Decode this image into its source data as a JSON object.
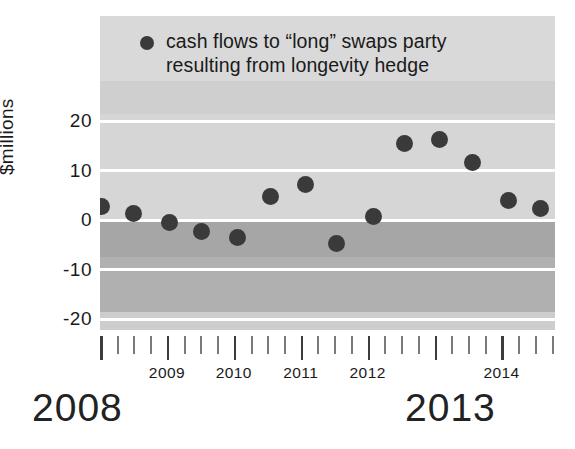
{
  "chart_data": {
    "type": "scatter",
    "title": "",
    "subtitle": "",
    "xlabel": "",
    "ylabel": "$millions",
    "ylim": [
      -25,
      28
    ],
    "xlim": [
      2008.0,
      2014.75
    ],
    "grid": true,
    "legend_position": "top-left-inside",
    "legend": [
      "cash flows to “long” swaps party\nresulting from longevity hedge"
    ],
    "yticks": [
      20,
      10,
      0,
      -10,
      -20
    ],
    "ytick_labels": [
      "20",
      "10",
      "0",
      "-10",
      "-20"
    ],
    "xtick_labels": [
      "2009",
      "2010",
      "2011",
      "2012",
      "2014"
    ],
    "xtick_label_values": [
      2009,
      2010,
      2011,
      2012,
      2014
    ],
    "series": [
      {
        "name": "cash flows to “long” swaps party resulting from longevity hedge",
        "marker": "circle",
        "color": "#3a3a3a",
        "x": [
          2008.12,
          2008.38,
          2008.63,
          2008.88,
          2009.25,
          2009.62,
          2010.0,
          2010.38,
          2010.87,
          2011.25,
          2011.62,
          2011.9,
          2012.25,
          2012.62
        ],
        "values": [
          2.8,
          1.4,
          -0.6,
          -2.4,
          -3.6,
          4.7,
          7.1,
          -4.7,
          0.8,
          15.5,
          16.3,
          11.7,
          4.0,
          2.4
        ]
      }
    ],
    "points": [
      {
        "x_px": 101,
        "value": 2.8
      },
      {
        "x_px": 133,
        "value": 1.4
      },
      {
        "x_px": 169,
        "value": -0.6
      },
      {
        "x_px": 201,
        "value": -2.4
      },
      {
        "x_px": 237,
        "value": -3.6
      },
      {
        "x_px": 270,
        "value": 4.7
      },
      {
        "x_px": 305,
        "value": 7.1
      },
      {
        "x_px": 336,
        "value": -4.7
      },
      {
        "x_px": 373,
        "value": 0.8
      },
      {
        "x_px": 404,
        "value": 15.5
      },
      {
        "x_px": 439,
        "value": 16.3
      },
      {
        "x_px": 472,
        "value": 11.7
      },
      {
        "x_px": 508,
        "value": 4.0
      },
      {
        "x_px": 540,
        "value": 2.4
      }
    ],
    "display_years": [
      "2008",
      "2013"
    ],
    "colors": {
      "marker": "#3a3a3a",
      "band_positive": "#d5d5d5",
      "band_negative": "#a9a9a9",
      "gridline": "#ffffff",
      "text": "#1a1a1a"
    }
  },
  "legend": {
    "line1": "cash flows to “long” swaps party",
    "line2": "resulting from longevity hedge"
  },
  "axes": {
    "y_label": "$millions",
    "y_ticks": [
      "20",
      "10",
      "0",
      "-10",
      "-20"
    ],
    "x_ticks": [
      "2009",
      "2010",
      "2011",
      "2012",
      "2014"
    ]
  },
  "display": {
    "year_left": "2008",
    "year_right": "2013"
  }
}
